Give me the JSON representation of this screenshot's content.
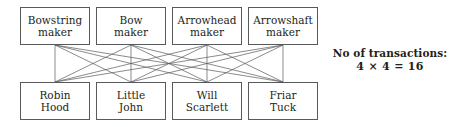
{
  "diagram": {
    "title_text": "",
    "suppliers_row": {
      "label": "suppliers",
      "nodes": [
        {
          "id": "bowstring-maker",
          "line1": "Bowstring",
          "line2": "maker",
          "x": 20,
          "y": 7,
          "w": 70,
          "h": 38
        },
        {
          "id": "bow-maker",
          "line1": "Bow",
          "line2": "maker",
          "x": 96,
          "y": 7,
          "w": 70,
          "h": 38
        },
        {
          "id": "arrowhead-maker",
          "line1": "Arrowhead",
          "line2": "maker",
          "x": 172,
          "y": 7,
          "w": 70,
          "h": 38
        },
        {
          "id": "arrowshaft-maker",
          "line1": "Arrowshaft",
          "line2": "maker",
          "x": 248,
          "y": 7,
          "w": 70,
          "h": 38
        }
      ]
    },
    "customers_row": {
      "label": "customers",
      "nodes": [
        {
          "id": "robin-hood",
          "line1": "Robin",
          "line2": "Hood",
          "x": 20,
          "y": 82,
          "w": 70,
          "h": 38
        },
        {
          "id": "little-john",
          "line1": "Little",
          "line2": "John",
          "x": 96,
          "y": 82,
          "w": 70,
          "h": 38
        },
        {
          "id": "will-scarlett",
          "line1": "Will",
          "line2": "Scarlett",
          "x": 172,
          "y": 82,
          "w": 70,
          "h": 38
        },
        {
          "id": "friar-tuck",
          "line1": "Friar",
          "line2": "Tuck",
          "x": 248,
          "y": 82,
          "w": 70,
          "h": 38
        }
      ]
    },
    "edges": {
      "count": 16,
      "color": "#58595b",
      "width": 0.7,
      "description": "every supplier connects to every customer"
    },
    "annotation": {
      "x": 330,
      "y": 46,
      "width": 120,
      "title_line": "No of transactions:",
      "formula_line": "4 × 4 = 16",
      "color": "#231f20"
    }
  },
  "colors": {
    "background": "#ffffff",
    "box_border": "#58595b",
    "text": "#231f20",
    "line": "#58595b"
  }
}
